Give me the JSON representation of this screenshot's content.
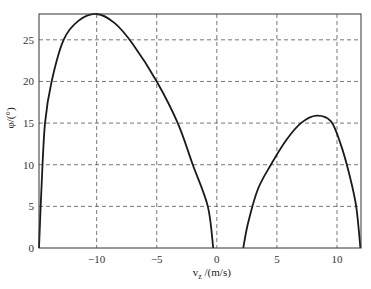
{
  "chart_data": {
    "type": "line",
    "title": "",
    "xlabel": "v_z /(m/s)",
    "xlabel_main": "v",
    "xlabel_sub": "z",
    "xlabel_rest": " /(m/s)",
    "ylabel": "φ/(°)",
    "xlim": [
      -14.8,
      12
    ],
    "ylim": [
      0,
      28.1
    ],
    "xticks": [
      -10,
      -5,
      0,
      5,
      10
    ],
    "xtick_labels": [
      "−10",
      "−5",
      "0",
      "5",
      "10"
    ],
    "yticks": [
      0,
      5,
      10,
      15,
      20,
      25
    ],
    "ytick_labels": [
      "0",
      "5",
      "10",
      "15",
      "20",
      "25"
    ],
    "grid": true,
    "grid_style": "dashed",
    "legend": null,
    "series": [
      {
        "name": "branch-negative",
        "x": [
          -14.8,
          -14.6,
          -14.3,
          -13.75,
          -12.75,
          -11.5,
          -10.0,
          -8.5,
          -7.0,
          -5.0,
          -3.25,
          -2.0,
          -0.75,
          -0.3
        ],
        "y": [
          0,
          7,
          15,
          20,
          25,
          27.3,
          28.1,
          27.0,
          24.5,
          20,
          15,
          10,
          5,
          0
        ]
      },
      {
        "name": "branch-positive",
        "x": [
          2.2,
          2.6,
          3.4,
          4.5,
          5.8,
          7.0,
          8.3,
          9.5,
          10.3,
          11.0,
          11.6,
          11.95
        ],
        "y": [
          0,
          3,
          7,
          10,
          13,
          15,
          15.9,
          15.2,
          12.5,
          9,
          5,
          0
        ]
      }
    ],
    "colors": {
      "line": "#1a1a1a",
      "grid": "#555555",
      "axes": "#333333"
    }
  }
}
